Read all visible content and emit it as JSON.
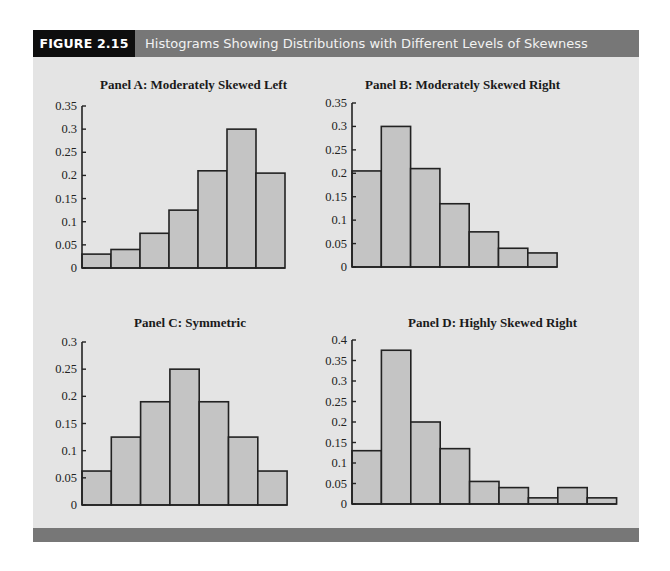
{
  "figure": {
    "label": "FIGURE 2.15",
    "title": "Histograms Showing Distributions with Different Levels of Skewness",
    "colors": {
      "header_bg": "#777777",
      "label_bg": "#0e0e0e",
      "panel_bg": "#e4e4e4",
      "bar_fill": "#c4c4c4",
      "bar_stroke": "#222222"
    }
  },
  "panels": [
    {
      "title": "Panel A: Moderately Skewed Left"
    },
    {
      "title": "Panel B: Moderately Skewed Right"
    },
    {
      "title": "Panel C: Symmetric"
    },
    {
      "title": "Panel D: Highly Skewed Right"
    }
  ],
  "chart_data": [
    {
      "type": "bar",
      "title": "Panel A: Moderately Skewed Left",
      "xlabel": "",
      "ylabel": "",
      "categories": [
        "1",
        "2",
        "3",
        "4",
        "5",
        "6",
        "7"
      ],
      "values": [
        0.03,
        0.04,
        0.075,
        0.125,
        0.21,
        0.3,
        0.205
      ],
      "ylim": [
        0,
        0.35
      ],
      "yticks": [
        "0",
        "0.05",
        "0.1",
        "0.15",
        "0.2",
        "0.25",
        "0.3",
        "0.35"
      ],
      "grid": false,
      "legend": false
    },
    {
      "type": "bar",
      "title": "Panel B: Moderately Skewed Right",
      "xlabel": "",
      "ylabel": "",
      "categories": [
        "1",
        "2",
        "3",
        "4",
        "5",
        "6",
        "7"
      ],
      "values": [
        0.205,
        0.3,
        0.21,
        0.135,
        0.075,
        0.04,
        0.03
      ],
      "ylim": [
        0,
        0.35
      ],
      "yticks": [
        "0",
        "0.05",
        "0.1",
        "0.15",
        "0.2",
        "0.25",
        "0.3",
        "0.35"
      ],
      "grid": false,
      "legend": false
    },
    {
      "type": "bar",
      "title": "Panel C: Symmetric",
      "xlabel": "",
      "ylabel": "",
      "categories": [
        "1",
        "2",
        "3",
        "4",
        "5",
        "6",
        "7"
      ],
      "values": [
        0.0625,
        0.125,
        0.19,
        0.25,
        0.19,
        0.125,
        0.0625
      ],
      "ylim": [
        0,
        0.3
      ],
      "yticks": [
        "0",
        "0.05",
        "0.1",
        "0.15",
        "0.2",
        "0.25",
        "0.3"
      ],
      "grid": false,
      "legend": false
    },
    {
      "type": "bar",
      "title": "Panel D: Highly Skewed Right",
      "xlabel": "",
      "ylabel": "",
      "categories": [
        "1",
        "2",
        "3",
        "4",
        "5",
        "6",
        "7",
        "8",
        "9"
      ],
      "values": [
        0.13,
        0.375,
        0.2,
        0.135,
        0.055,
        0.04,
        0.015,
        0.04,
        0.015
      ],
      "ylim": [
        0,
        0.4
      ],
      "yticks": [
        "0",
        "0.05",
        "0.1",
        "0.15",
        "0.2",
        "0.25",
        "0.3",
        "0.35",
        "0.4"
      ],
      "grid": false,
      "legend": false
    }
  ]
}
